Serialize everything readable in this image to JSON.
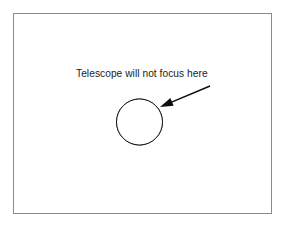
{
  "figure": {
    "canvas": {
      "width": 287,
      "height": 231,
      "background_color": "#ffffff"
    },
    "frame": {
      "x": 13.5,
      "y": 13.5,
      "width": 258,
      "height": 200,
      "stroke_color": "#8a8a8a",
      "stroke_width": 1
    },
    "annotation": {
      "label": "Telescope will not focus here",
      "x": 76,
      "y": 77,
      "font_size": 10.2,
      "color": "#1a1a1a"
    },
    "arrow": {
      "tail_x": 210,
      "tail_y": 86,
      "tip_x": 160,
      "tip_y": 107,
      "color": "#0d0d0d",
      "stroke_width": 1.4
    },
    "circle": {
      "center_x": 139.5,
      "center_y": 122,
      "radius": 23,
      "outline_color": "#1a1a1a",
      "fill_color": "#ffffff",
      "fill_level_y": 119,
      "pattern": "checkerboard-dither",
      "pattern_dark_color": "#111111",
      "pattern_light_color": "#ffffff"
    }
  }
}
